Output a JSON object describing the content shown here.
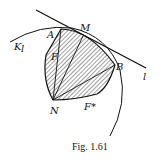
{
  "figure": {
    "caption": "Fig. 1.61",
    "labels": {
      "K": "K",
      "K_sub": "l",
      "A": "A",
      "M": "M",
      "B": "B",
      "N": "N",
      "F": "F",
      "F_star": "F*",
      "l": "l"
    },
    "colors": {
      "ink": "#111111",
      "background": "#ffffff"
    }
  }
}
